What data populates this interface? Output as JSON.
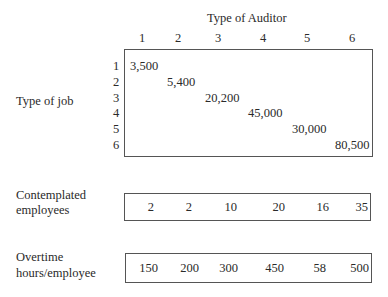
{
  "auditor_header": "Type of Auditor",
  "columns": [
    "1",
    "2",
    "3",
    "4",
    "5",
    "6"
  ],
  "job_label": "Type of job",
  "rows": [
    "1",
    "2",
    "3",
    "4",
    "5",
    "6"
  ],
  "diagonal_values": [
    "3,500",
    "5,400",
    "20,200",
    "45,000",
    "30,000",
    "80,500"
  ],
  "contemplated": {
    "label_line1": "Contemplated",
    "label_line2": "employees",
    "values": [
      "2",
      "2",
      "10",
      "20",
      "16",
      "35"
    ]
  },
  "overtime": {
    "label_line1": "Overtime",
    "label_line2": "hours/employee",
    "values": [
      "150",
      "200",
      "300",
      "450",
      "58",
      "500"
    ]
  }
}
